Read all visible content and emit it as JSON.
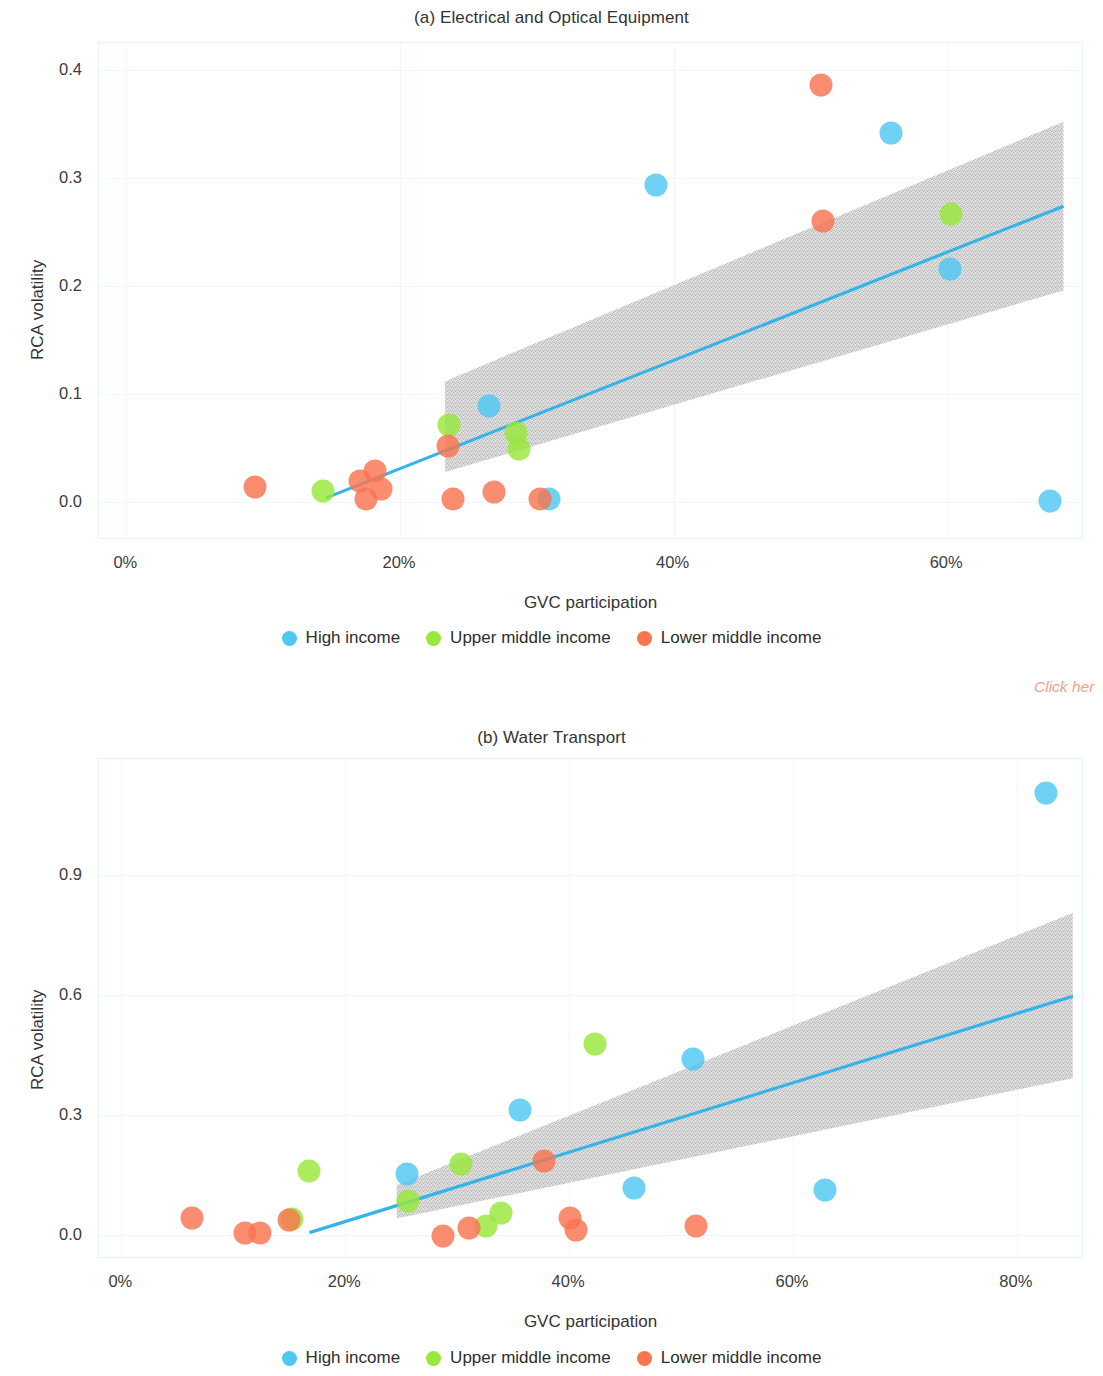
{
  "colors": {
    "high_income": "#4FC7F0",
    "upper_middle_income": "#97E83A",
    "lower_middle_income": "#F9744F",
    "trend_line": "#36B4E8",
    "confidence_band": "#BFBFBF",
    "grid": "#EEF9FB",
    "axis_border": "#E2F5F8",
    "click_link": "#F7A183"
  },
  "legend": {
    "items": [
      {
        "label": "High income",
        "color_key": "high_income"
      },
      {
        "label": "Upper middle income",
        "color_key": "upper_middle_income"
      },
      {
        "label": "Lower middle income",
        "color_key": "lower_middle_income"
      }
    ]
  },
  "annotations": {
    "click_here": "Click her"
  },
  "chart_data": [
    {
      "id": "a",
      "type": "scatter",
      "title": "(a) Electrical and Optical Equipment",
      "xlabel": "GVC participation",
      "ylabel": "RCA volatility",
      "xlim": [
        -2,
        70
      ],
      "ylim": [
        -0.035,
        0.425
      ],
      "xticks": [
        0,
        20,
        40,
        60
      ],
      "xticklabels": [
        "0%",
        "20%",
        "40%",
        "60%"
      ],
      "yticks": [
        0.0,
        0.1,
        0.2,
        0.3,
        0.4
      ],
      "yticklabels": [
        "0.0",
        "0.1",
        "0.2",
        "0.3",
        "0.4"
      ],
      "grid": true,
      "legend_position": "bottom",
      "trend": {
        "x0": 14.6,
        "y0": 0.004,
        "x1": 68.5,
        "y1": 0.274
      },
      "band": {
        "x_start": 23.3,
        "x_end": 68.5,
        "upper": [
          0.112,
          0.352
        ],
        "lower": [
          0.028,
          0.196
        ]
      },
      "series": [
        {
          "name": "High income",
          "color_key": "high_income",
          "points": [
            {
              "x": 38.7,
              "y": 0.294
            },
            {
              "x": 55.9,
              "y": 0.342
            },
            {
              "x": 60.2,
              "y": 0.216
            },
            {
              "x": 26.5,
              "y": 0.089
            },
            {
              "x": 30.9,
              "y": 0.003
            },
            {
              "x": 67.5,
              "y": 0.001
            }
          ]
        },
        {
          "name": "Upper middle income",
          "color_key": "upper_middle_income",
          "points": [
            {
              "x": 14.4,
              "y": 0.01
            },
            {
              "x": 23.6,
              "y": 0.071
            },
            {
              "x": 28.5,
              "y": 0.064
            },
            {
              "x": 28.7,
              "y": 0.049
            },
            {
              "x": 60.3,
              "y": 0.267
            }
          ]
        },
        {
          "name": "Lower middle income",
          "color_key": "lower_middle_income",
          "points": [
            {
              "x": 9.4,
              "y": 0.014
            },
            {
              "x": 17.1,
              "y": 0.02
            },
            {
              "x": 17.5,
              "y": 0.003
            },
            {
              "x": 18.2,
              "y": 0.029
            },
            {
              "x": 18.6,
              "y": 0.012
            },
            {
              "x": 23.5,
              "y": 0.052
            },
            {
              "x": 23.9,
              "y": 0.003
            },
            {
              "x": 26.9,
              "y": 0.009
            },
            {
              "x": 30.2,
              "y": 0.003
            },
            {
              "x": 50.8,
              "y": 0.386
            },
            {
              "x": 50.9,
              "y": 0.26
            }
          ]
        }
      ]
    },
    {
      "id": "b",
      "type": "scatter",
      "title": "(b) Water Transport",
      "xlabel": "GVC participation",
      "ylabel": "RCA volatility",
      "xlim": [
        -2,
        86
      ],
      "ylim": [
        -0.06,
        1.19
      ],
      "xticks": [
        0,
        20,
        40,
        60,
        80
      ],
      "xticklabels": [
        "0%",
        "20%",
        "40%",
        "60%",
        "80%"
      ],
      "yticks": [
        0.0,
        0.3,
        0.6,
        0.9
      ],
      "yticklabels": [
        "0.0",
        "0.3",
        "0.6",
        "0.9"
      ],
      "grid": true,
      "legend_position": "bottom",
      "trend": {
        "x0": 16.8,
        "y0": 0.006,
        "x1": 85.0,
        "y1": 0.597
      },
      "band": {
        "x_start": 24.6,
        "x_end": 85.0,
        "upper": [
          0.125,
          0.805
        ],
        "lower": [
          0.041,
          0.392
        ]
      },
      "series": [
        {
          "name": "High income",
          "color_key": "high_income",
          "points": [
            {
              "x": 82.6,
              "y": 1.105
            },
            {
              "x": 51.1,
              "y": 0.441
            },
            {
              "x": 35.6,
              "y": 0.312
            },
            {
              "x": 25.5,
              "y": 0.152
            },
            {
              "x": 45.8,
              "y": 0.117
            },
            {
              "x": 62.9,
              "y": 0.113
            }
          ]
        },
        {
          "name": "Upper middle income",
          "color_key": "upper_middle_income",
          "points": [
            {
              "x": 16.8,
              "y": 0.16
            },
            {
              "x": 30.3,
              "y": 0.178
            },
            {
              "x": 42.3,
              "y": 0.478
            },
            {
              "x": 25.6,
              "y": 0.086
            },
            {
              "x": 33.9,
              "y": 0.055
            },
            {
              "x": 32.6,
              "y": 0.022
            },
            {
              "x": 15.2,
              "y": 0.041
            }
          ]
        },
        {
          "name": "Lower middle income",
          "color_key": "lower_middle_income",
          "points": [
            {
              "x": 6.3,
              "y": 0.042
            },
            {
              "x": 11.0,
              "y": 0.004
            },
            {
              "x": 12.4,
              "y": 0.004
            },
            {
              "x": 15.0,
              "y": 0.038
            },
            {
              "x": 28.7,
              "y": -0.002
            },
            {
              "x": 31.1,
              "y": 0.018
            },
            {
              "x": 37.8,
              "y": 0.184
            },
            {
              "x": 40.1,
              "y": 0.043
            },
            {
              "x": 40.6,
              "y": 0.012
            },
            {
              "x": 51.3,
              "y": 0.023
            }
          ]
        }
      ]
    }
  ]
}
